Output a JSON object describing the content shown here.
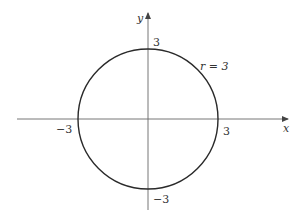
{
  "diagram": {
    "type": "circle-on-axes",
    "colors": {
      "stroke": "#2a2a2a",
      "axis": "#555555",
      "text": "#333333",
      "background": "#ffffff"
    },
    "axes": {
      "x_label": "x",
      "y_label": "y"
    },
    "circle": {
      "label": "r = 3",
      "radius": 3
    },
    "ticks": {
      "x_pos": "3",
      "x_neg": "−3",
      "y_pos": "3",
      "y_neg": "−3"
    }
  }
}
